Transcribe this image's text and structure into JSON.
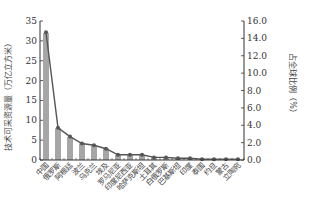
{
  "chart_data": {
    "type": "bar",
    "title": "",
    "categories": [
      "中国",
      "俄罗斯",
      "阿根廷",
      "波兰",
      "乌克兰",
      "埃及",
      "罗马尼亚",
      "印度尼西亚",
      "哈萨克斯坦",
      "土耳其",
      "白俄罗斯",
      "巴基斯坦",
      "印度",
      "泰国",
      "约旦",
      "蒙古",
      "立陶宛"
    ],
    "series": [
      {
        "name": "技术可采资源量",
        "type": "bar",
        "axis": "left",
        "color": "#a6a6a6",
        "values": [
          32.0,
          8.0,
          5.8,
          4.2,
          3.6,
          2.9,
          1.3,
          1.2,
          1.2,
          0.7,
          0.7,
          0.5,
          0.4,
          0.3,
          0.3,
          0.2,
          0.2
        ]
      },
      {
        "name": "占全球比例",
        "type": "line",
        "axis": "right",
        "color": "#555555",
        "values": [
          14.7,
          3.7,
          2.7,
          1.9,
          1.7,
          1.3,
          0.6,
          0.6,
          0.6,
          0.3,
          0.3,
          0.2,
          0.2,
          0.1,
          0.1,
          0.1,
          0.1
        ]
      }
    ],
    "ylabel": "技术可采资源量（万亿立方米）",
    "ylabel_right": "占全球比例（%）",
    "ylim": [
      0,
      35
    ],
    "ylim_right": [
      0,
      16
    ],
    "yticks": [
      "0",
      "5",
      "10",
      "15",
      "20",
      "25",
      "30",
      "35"
    ],
    "yticks_right": [
      "0.0",
      "2.0",
      "4.0",
      "6.0",
      "8.0",
      "10.0",
      "12.0",
      "14.0",
      "16.0"
    ],
    "grid": false,
    "legend": "none"
  }
}
